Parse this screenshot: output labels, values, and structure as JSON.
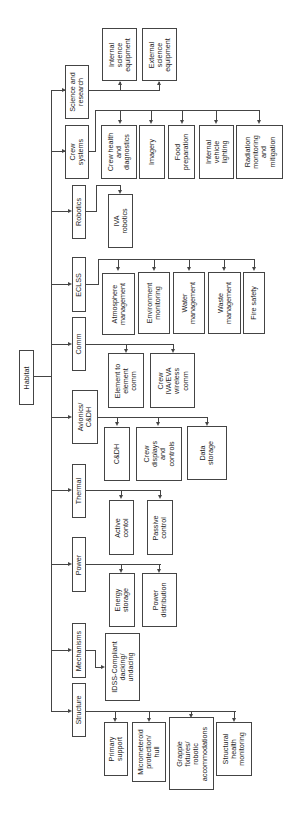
{
  "root": {
    "label": "Habitat"
  },
  "subsystems": [
    {
      "label": "Structure",
      "children": [
        "Primary\nsupport",
        "Micrometeroid\nprotection/\nhull",
        "Grapple\nfixtures/\nrobotic\naccommodations",
        "Structural\nhealth\nmonitoring"
      ]
    },
    {
      "label": "Mechanisms",
      "children": [
        "IDSS-Compliant\ndacking/\nundacing"
      ]
    },
    {
      "label": "Power",
      "children": [
        "Energy\nstorage",
        "Power\ndistribution"
      ]
    },
    {
      "label": "Thermal",
      "children": [
        "Active\ncontol",
        "Passive\ncontrol"
      ]
    },
    {
      "label": "Avionics/\nC&DH",
      "children": [
        "C&DH",
        "Crew\ndisplays\nand\ncontrols",
        "Data\nstorage"
      ]
    },
    {
      "label": "Comm",
      "children": [
        "Element to\nelement\ncomm",
        "Crew\nIVA/EVA\nwireless\ncomm"
      ]
    },
    {
      "label": "ECLSS",
      "children": [
        "Atmosphere\nmanagement",
        "Environment\nmonitoring",
        "Water\nmanagement",
        "Waste\nmanagement",
        "Fire safety"
      ]
    },
    {
      "label": "Robotics",
      "children": [
        "IVA\nrobotics"
      ]
    },
    {
      "label": "Crew\nsystems",
      "children": [
        "Crew health\nand\ndiagnostics",
        "Imagery",
        "Food\npreparation",
        "Internal\nvehicle\nlighting",
        "Radiation\nmonitoring\nand\nmitigation"
      ]
    },
    {
      "label": "Science and\nresearch",
      "children": [
        "Internal\nscience\nequipment",
        "External\nscience\nequipment"
      ]
    }
  ],
  "colors": {
    "line": "#444444",
    "background": "#ffffff"
  }
}
